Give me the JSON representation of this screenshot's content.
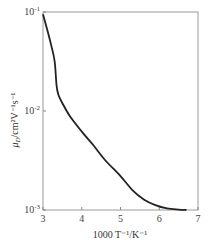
{
  "chart_data": {
    "type": "line",
    "title": "",
    "xlabel": "1000 T⁻¹/K⁻¹",
    "ylabel": "μ_D/cm²V⁻¹s⁻¹",
    "xlim": [
      3,
      7
    ],
    "ylim": [
      0.001,
      0.1
    ],
    "yscale": "log",
    "grid": false,
    "legend": null,
    "x_ticks": [
      "3",
      "4",
      "5",
      "6",
      "7"
    ],
    "y_ticks": [
      {
        "base": "10",
        "exp": "-1",
        "value": 0.1
      },
      {
        "base": "10",
        "exp": "-2",
        "value": 0.01
      },
      {
        "base": "10",
        "exp": "-3",
        "value": 0.001
      }
    ],
    "series": [
      {
        "name": "mobility",
        "x": [
          3.0,
          3.1,
          3.2,
          3.3,
          3.35,
          3.4,
          3.5,
          3.7,
          4.0,
          4.3,
          4.6,
          5.0,
          5.3,
          5.6,
          5.9,
          6.2,
          6.5,
          6.7
        ],
        "y": [
          0.095,
          0.068,
          0.048,
          0.032,
          0.018,
          0.0145,
          0.012,
          0.0088,
          0.0062,
          0.0045,
          0.0032,
          0.0022,
          0.0016,
          0.00128,
          0.00112,
          0.00104,
          0.00101,
          0.001
        ]
      }
    ]
  },
  "labels": {
    "x_axis": "1000 T⁻¹/K⁻¹",
    "y_axis_main": "μ",
    "y_axis_sub": "D",
    "y_axis_rest": "/cm²V⁻¹s⁻¹"
  }
}
